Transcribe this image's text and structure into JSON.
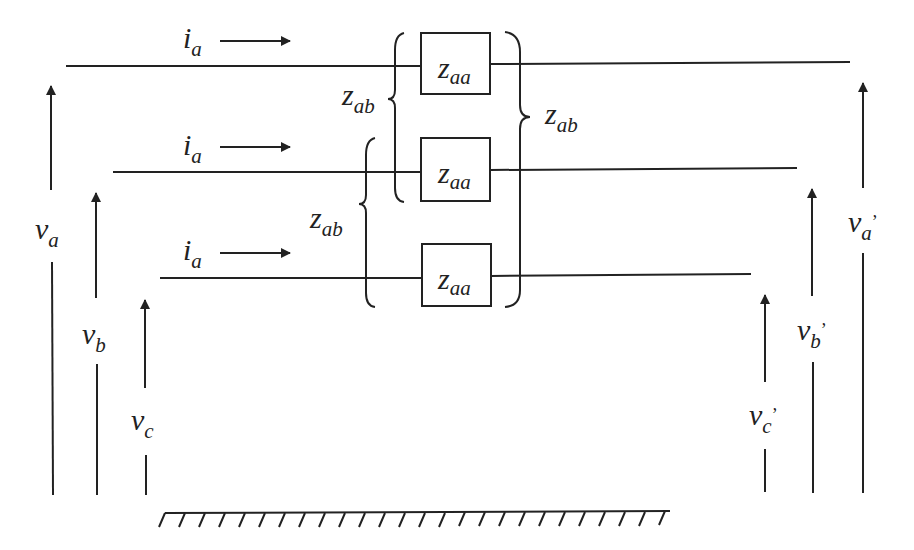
{
  "diagram": {
    "conductors": [
      {
        "id": "a",
        "current": {
          "main": "i",
          "sub": "a"
        },
        "impedance": {
          "main": "z",
          "sub": "aa"
        }
      },
      {
        "id": "b",
        "current": {
          "main": "i",
          "sub": "a"
        },
        "impedance": {
          "main": "z",
          "sub": "aa"
        }
      },
      {
        "id": "c",
        "current": {
          "main": "i",
          "sub": "a"
        },
        "impedance": {
          "main": "z",
          "sub": "aa"
        }
      }
    ],
    "mutuals": [
      {
        "label": {
          "main": "z",
          "sub": "ab"
        },
        "between": "a-b"
      },
      {
        "label": {
          "main": "z",
          "sub": "ab"
        },
        "between": "b-c"
      },
      {
        "label": {
          "main": "z",
          "sub": "ab"
        },
        "between": "a-c"
      }
    ],
    "sending_voltages": [
      {
        "main": "v",
        "sub": "a"
      },
      {
        "main": "v",
        "sub": "b"
      },
      {
        "main": "v",
        "sub": "c"
      }
    ],
    "receiving_voltages": [
      {
        "main": "v",
        "sub": "a",
        "prime": "’"
      },
      {
        "main": "v",
        "sub": "b",
        "prime": "’"
      },
      {
        "main": "v",
        "sub": "c",
        "prime": "’"
      }
    ],
    "ground": "ground-reference"
  }
}
